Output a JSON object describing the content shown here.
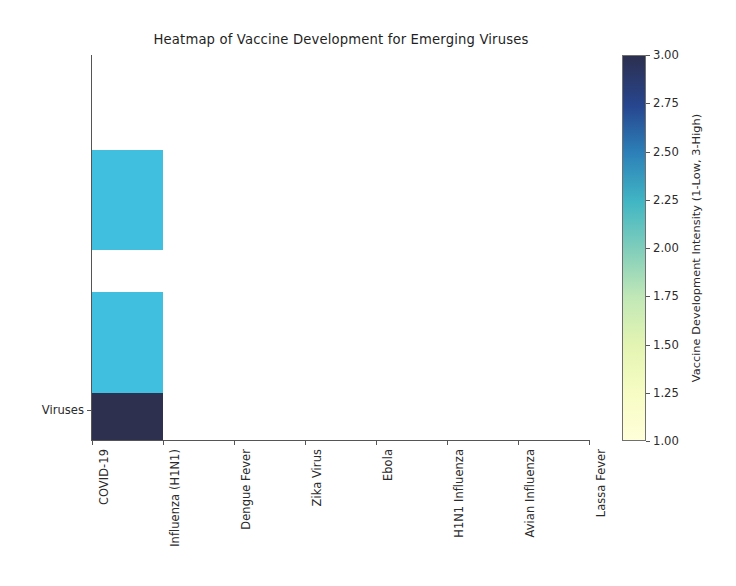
{
  "chart_data": {
    "type": "heatmap",
    "title": "Heatmap of Vaccine Development for Emerging Viruses",
    "xlabel": "",
    "ylabel": "",
    "categories": [
      "COVID-19",
      "Influenza (H1N1)",
      "Dengue Fever",
      "Zika Virus",
      "Ebola",
      "H1N1 Influenza",
      "Avian Influenza",
      "Lassa Fever"
    ],
    "rows": [
      "Viruses"
    ],
    "ytick_labels": [
      "Viruses"
    ],
    "colorbar": {
      "label": "Vaccine Development Intensity (1-Low, 3-High)",
      "ticks": [
        "3.00",
        "2.75",
        "2.50",
        "2.25",
        "2.00",
        "1.75",
        "1.50",
        "1.25",
        "1.00"
      ],
      "vmin": 1.0,
      "vmax": 3.0,
      "colormap": "YlGnBu",
      "stops": [
        {
          "pos": 0,
          "color": "#ffffd9"
        },
        {
          "pos": 12,
          "color": "#f7fcc4"
        },
        {
          "pos": 25,
          "color": "#e3f4b2"
        },
        {
          "pos": 37,
          "color": "#c2e8b7"
        },
        {
          "pos": 50,
          "color": "#7fcdbb"
        },
        {
          "pos": 62,
          "color": "#41b6c4"
        },
        {
          "pos": 75,
          "color": "#2c7fb8"
        },
        {
          "pos": 87,
          "color": "#27468f"
        },
        {
          "pos": 100,
          "color": "#2c2f4f"
        }
      ]
    },
    "cells": [
      {
        "category": "COVID-19",
        "value": 2.0,
        "color": "#41bfdf",
        "x": 0,
        "y": 150,
        "w": 71,
        "h": 100
      },
      {
        "category": "COVID-19",
        "value": 2.0,
        "color": "#41bfdf",
        "x": 0,
        "y": 292,
        "w": 71,
        "h": 101
      },
      {
        "category": "COVID-19",
        "value": 3.0,
        "color": "#2e3050",
        "x": 0,
        "y": 393,
        "w": 71,
        "h": 47
      }
    ],
    "axis": {
      "plot_left": 92,
      "plot_top": 55,
      "plot_width": 498,
      "plot_height": 385,
      "xtick_positions": [
        92,
        163,
        234,
        305,
        376,
        447,
        518,
        589
      ],
      "ytick_position": 410
    }
  },
  "colors": {
    "cell_cyan": "#41bfdf",
    "cell_navy": "#2e3050",
    "spine": "#555555",
    "text": "#2b2b2b",
    "background": "#ffffff"
  }
}
